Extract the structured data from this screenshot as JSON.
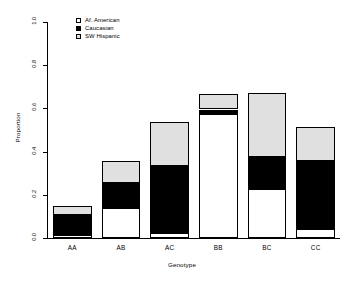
{
  "chart_data": {
    "type": "bar",
    "stacked": true,
    "title": "",
    "xlabel": "Genotype",
    "ylabel": "Proportion",
    "categories": [
      "AA",
      "AB",
      "AC",
      "BB",
      "BC",
      "CC"
    ],
    "ylim": [
      0.0,
      1.0
    ],
    "yticks": [
      "0.0",
      "0.2",
      "0.4",
      "0.6",
      "0.8",
      "1.0"
    ],
    "ytick_values": [
      0.0,
      0.2,
      0.4,
      0.6,
      0.8,
      1.0
    ],
    "grid": false,
    "legend_position": "top-left inside plot",
    "series": [
      {
        "name": "Af. American",
        "color": "#ffffff",
        "values": [
          0.015,
          0.14,
          0.025,
          0.575,
          0.225,
          0.04
        ]
      },
      {
        "name": "Caucasian",
        "color": "#000000",
        "values": [
          0.09,
          0.115,
          0.31,
          0.02,
          0.15,
          0.315
        ]
      },
      {
        "name": "SW Hispanic",
        "color": "#e0e0e0",
        "values": [
          0.045,
          0.1,
          0.2,
          0.07,
          0.295,
          0.16
        ]
      }
    ],
    "totals": [
      0.15,
      0.355,
      0.535,
      0.665,
      0.67,
      0.515
    ]
  },
  "legend": {
    "items": [
      {
        "label": "Af. American",
        "swatch": "white-square-icon"
      },
      {
        "label": "Caucasian",
        "swatch": "black-square-icon"
      },
      {
        "label": "SW Hispanic",
        "swatch": "gray-square-icon"
      }
    ]
  },
  "axes": {
    "y_title": "Proportion",
    "x_title": "Genotype"
  }
}
